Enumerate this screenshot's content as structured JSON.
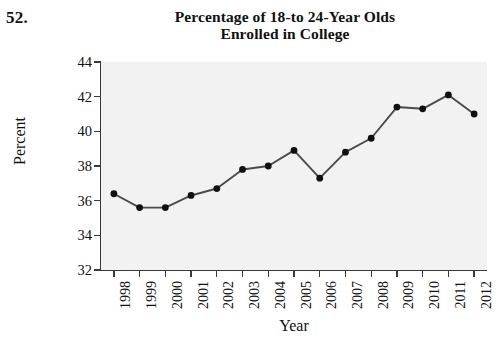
{
  "problem_number": "52.",
  "title": {
    "line1": "Percentage of 18-to 24-Year Olds",
    "line2": "Enrolled in College"
  },
  "axes": {
    "ylabel": "Percent",
    "xlabel": "Year",
    "yticks": [
      "32",
      "34",
      "36",
      "38",
      "40",
      "42",
      "44"
    ],
    "xticks": [
      "1998",
      "1999",
      "2000",
      "2001",
      "2002",
      "2003",
      "2004",
      "2005",
      "2006",
      "2007",
      "2008",
      "2009",
      "2010",
      "2011",
      "2012"
    ]
  },
  "colors": {
    "plot_background": "#f2f2f2",
    "axis": "#3a3a3a",
    "line": "#4a4a4a",
    "marker": "#101010",
    "text": "#111111"
  },
  "chart_data": {
    "type": "line",
    "title": "Percentage of 18-to 24-Year Olds Enrolled in College",
    "xlabel": "Year",
    "ylabel": "Percent",
    "ylim": [
      32,
      44
    ],
    "ytick_step": 2,
    "grid": false,
    "legend": null,
    "markers": "filled-circle",
    "categories": [
      1998,
      1999,
      2000,
      2001,
      2002,
      2003,
      2004,
      2005,
      2006,
      2007,
      2008,
      2009,
      2010,
      2011,
      2012
    ],
    "values": [
      36.4,
      35.6,
      35.6,
      36.3,
      36.7,
      37.8,
      38.0,
      38.9,
      37.3,
      38.8,
      39.6,
      41.4,
      41.3,
      42.1,
      41.0
    ]
  }
}
